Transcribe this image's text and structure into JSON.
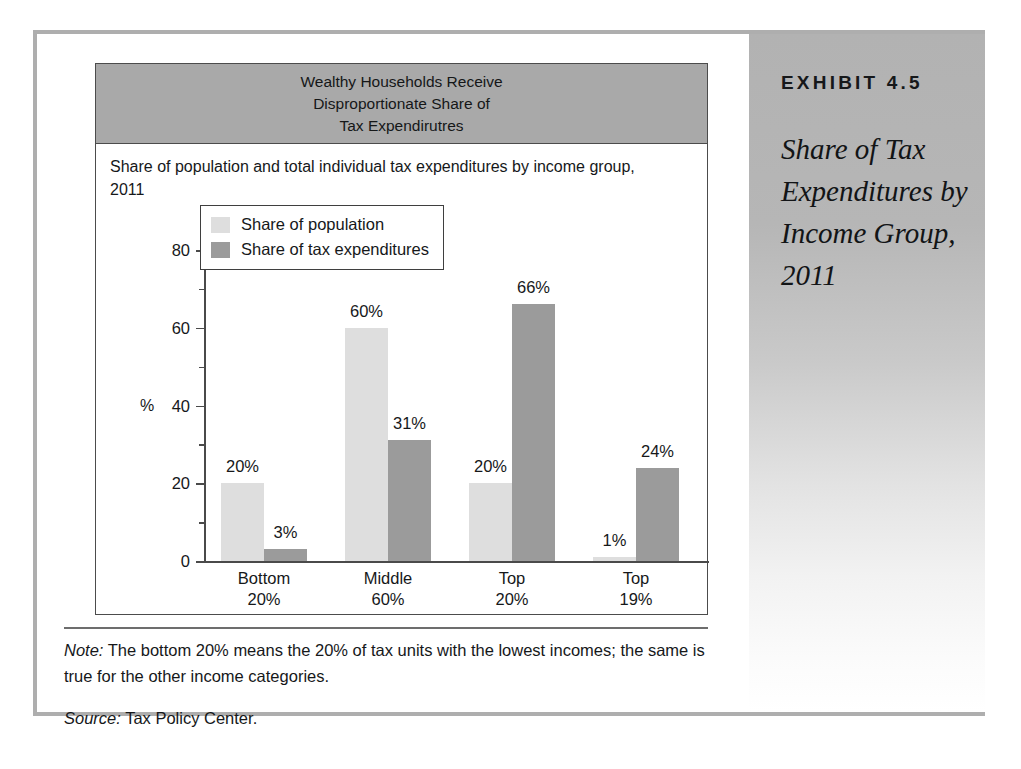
{
  "sidebar": {
    "kicker": "EXHIBIT 4.5",
    "title": "Share of Tax Expenditures by Income Group, 2011"
  },
  "notes": {
    "note_label": "Note:",
    "note_text": " The bottom 20% means the 20% of tax units with the lowest incomes; the same is true for the other income categories.",
    "source_label": "Source:",
    "source_text": " Tax Policy Center."
  },
  "colors": {
    "banner": "#a9a9a9",
    "series_population": "#dedede",
    "series_expenditures": "#9b9b9b",
    "frame": "#aeaeae",
    "text": "#16181a"
  },
  "chart_data": {
    "type": "bar",
    "title": "Wealthy Households Receive Disproportionate Share of Tax Expendirutres",
    "title_lines": [
      "Wealthy Households Receive",
      "Disproportionate Share of",
      "Tax Expendirutres"
    ],
    "subtitle": "Share of population and total individual tax expenditures by income group, 2011",
    "xlabel": "",
    "ylabel": "%",
    "ylim": [
      0,
      80
    ],
    "yticks": [
      0,
      20,
      40,
      60,
      80
    ],
    "ytick_labels": [
      "0",
      "20",
      "40",
      "60",
      "80"
    ],
    "yminor_ticks": [
      10,
      30,
      50,
      70
    ],
    "grid": false,
    "legend_position": "upper-left-inside",
    "categories": [
      "Bottom 20%",
      "Middle 60%",
      "Top 20%",
      "Top 19%"
    ],
    "category_lines": [
      [
        "Bottom",
        "20%"
      ],
      [
        "Middle",
        "60%"
      ],
      [
        "Top",
        "20%"
      ],
      [
        "Top",
        "19%"
      ]
    ],
    "series": [
      {
        "name": "Share of population",
        "color": "#dedede",
        "values": [
          20,
          60,
          20,
          1
        ],
        "labels": [
          "20%",
          "60%",
          "20%",
          "1%"
        ]
      },
      {
        "name": "Share of tax expenditures",
        "color": "#9b9b9b",
        "values": [
          3,
          31,
          66,
          24
        ],
        "labels": [
          "3%",
          "31%",
          "66%",
          "24%"
        ]
      }
    ]
  }
}
